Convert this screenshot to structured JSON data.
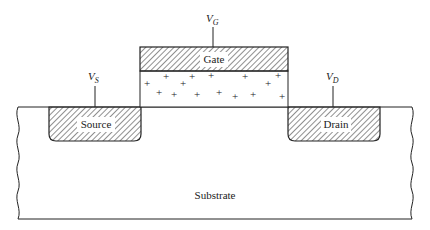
{
  "diagram": {
    "regions": {
      "gate": {
        "label": "Gate"
      },
      "source": {
        "label": "Source"
      },
      "drain": {
        "label": "Drain"
      },
      "substrate": {
        "label": "Substrate"
      },
      "oxide": {
        "charge_symbol": "+",
        "charge_count": 15
      }
    },
    "terminals": {
      "gate": {
        "main": "V",
        "sub": "G"
      },
      "source": {
        "main": "V",
        "sub": "S"
      },
      "drain": {
        "main": "V",
        "sub": "D"
      }
    },
    "colors": {
      "line": "#222222",
      "background": "#ffffff",
      "label_bg": "#ffffff"
    }
  }
}
